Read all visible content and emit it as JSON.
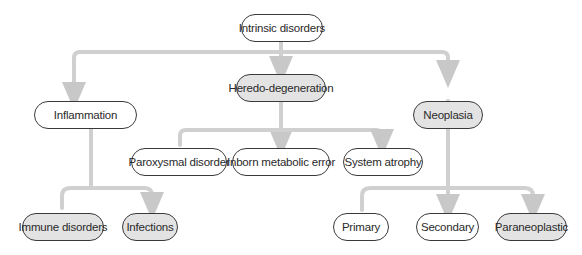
{
  "diagram": {
    "root": {
      "label": "Intrinsic disorders",
      "shaded": false
    },
    "level1": [
      {
        "label": "Inflammation",
        "shaded": false
      },
      {
        "label": "Heredo-degeneration",
        "shaded": true
      },
      {
        "label": "Neoplasia",
        "shaded": true
      }
    ],
    "inflammation_children": [
      {
        "label": "Immune disorders",
        "shaded": true
      },
      {
        "label": "Infections",
        "shaded": true
      }
    ],
    "heredo_children": [
      {
        "label": "Paroxysmal disorder",
        "shaded": false
      },
      {
        "label": "Inborn metabolic error",
        "shaded": false
      },
      {
        "label": "System atrophy",
        "shaded": false
      }
    ],
    "neoplasia_children": [
      {
        "label": "Primary",
        "shaded": false
      },
      {
        "label": "Secondary",
        "shaded": false
      },
      {
        "label": "Paraneoplastic",
        "shaded": true
      }
    ],
    "colors": {
      "connector": "#d0d0d0",
      "node_border": "#3a3a3a",
      "shaded_fill": "#e3e3e3"
    }
  }
}
